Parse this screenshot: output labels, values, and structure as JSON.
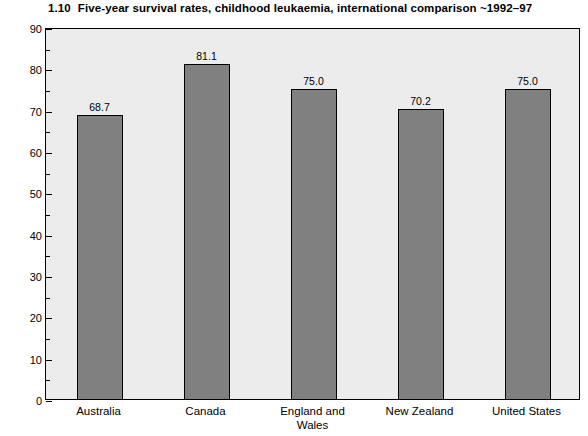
{
  "chart_data": {
    "type": "bar",
    "title_number": "1.10",
    "title_text": "Five-year survival rates, childhood leukaemia, international comparison ~1992–97",
    "xlabel": "",
    "ylabel": "% patients surviving 5 years after diagnosis",
    "categories": [
      "Australia",
      "Canada",
      "England and\nWales",
      "New Zealand",
      "United States"
    ],
    "values": [
      68.7,
      81.1,
      75.0,
      70.2,
      75.0
    ],
    "value_labels": [
      "68.7",
      "81.1",
      "75.0",
      "70.2",
      "75.0"
    ],
    "ylim": [
      0,
      90
    ],
    "ytick_step": 10,
    "yminor_step": 5,
    "ytick_labels": [
      "0",
      "10",
      "20",
      "30",
      "40",
      "50",
      "60",
      "70",
      "80",
      "90"
    ],
    "ytick_values": [
      0,
      10,
      20,
      30,
      40,
      50,
      60,
      70,
      80,
      90
    ],
    "grid": false,
    "legend": false,
    "colors": {
      "bar_fill": "#808080",
      "bar_border": "#000000",
      "plot_background": "#ececec",
      "page_background": "#ffffff",
      "text": "#000000"
    }
  }
}
